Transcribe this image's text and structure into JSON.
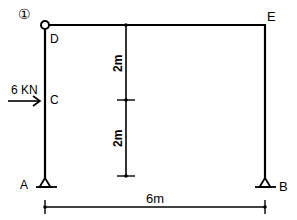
{
  "figure": {
    "number_label": "①",
    "structure": "hinged frame with two pinned supports",
    "nodes": [
      {
        "id": "D",
        "label": "D",
        "type": "hinge"
      },
      {
        "id": "E",
        "label": "E",
        "type": "rigid-corner"
      },
      {
        "id": "C",
        "label": "C",
        "type": "load-point"
      },
      {
        "id": "A",
        "label": "A",
        "type": "pin-support"
      },
      {
        "id": "B",
        "label": "B",
        "type": "pin-support"
      }
    ],
    "load": {
      "magnitude_label": "6 KN",
      "direction": "right",
      "node": "C"
    },
    "dimensions": {
      "vertical": [
        {
          "label": "2m"
        },
        {
          "label": "2m"
        }
      ],
      "horizontal": {
        "label": "6m"
      }
    },
    "line_color": "#000000",
    "background": "#ffffff"
  }
}
